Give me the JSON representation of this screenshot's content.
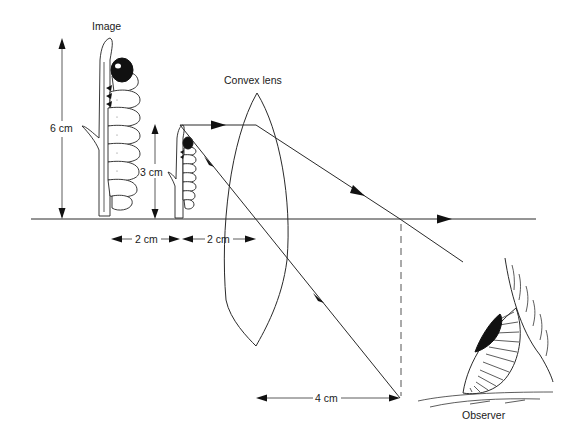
{
  "diagram": {
    "labels": {
      "image": "Image",
      "lens": "Convex lens",
      "observer": "Observer",
      "image_height": "6 cm",
      "object_height": "3 cm",
      "image_to_object_distance": "2 cm",
      "object_to_lens_distance": "2 cm",
      "lens_to_focus_distance": "4 cm"
    },
    "elements": [
      {
        "name": "principal-axis",
        "type": "line"
      },
      {
        "name": "convex-lens",
        "type": "biconvex lens"
      },
      {
        "name": "object",
        "type": "caterpillar on twig",
        "height": "3 cm"
      },
      {
        "name": "virtual-image",
        "type": "caterpillar on twig (enlarged)",
        "height": "6 cm"
      },
      {
        "name": "ray-parallel",
        "description": "parallel to axis, refracted through focal point toward observer"
      },
      {
        "name": "ray-through-lens",
        "description": "from object top through lens"
      },
      {
        "name": "focal-marker",
        "type": "dashed vertical line"
      },
      {
        "name": "observer-eye",
        "type": "eye drawing"
      }
    ],
    "colors": {
      "ink": "#222222",
      "background": "#ffffff"
    }
  }
}
